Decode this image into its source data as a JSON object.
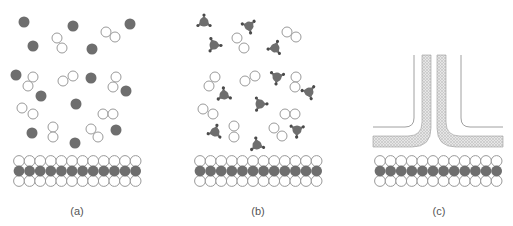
{
  "figure": {
    "panels": [
      {
        "id": "a",
        "label": "(a)",
        "description": "Free dark particles and hollow molecule pairs above a bilayer membrane"
      },
      {
        "id": "b",
        "label": "(b)",
        "description": "Triangular particles with bound dots and hollow molecule pairs above a bilayer membrane"
      },
      {
        "id": "c",
        "label": "(c)",
        "description": "Channel/pore structure with hatched lining above a bilayer membrane"
      }
    ]
  },
  "colors": {
    "dark": "#6e6e6e",
    "hollow_stroke": "#9a9a9a",
    "hatch": "#b5b5b5",
    "line": "#a0a0a0"
  },
  "panel_a": {
    "dark_particles": [
      [
        24,
        22
      ],
      [
        73,
        26
      ],
      [
        130,
        24
      ],
      [
        33,
        46
      ],
      [
        92,
        49
      ],
      [
        16,
        75
      ],
      [
        91,
        78
      ],
      [
        126,
        91
      ],
      [
        41,
        96
      ],
      [
        76,
        104
      ],
      [
        32,
        133
      ],
      [
        116,
        130
      ],
      [
        75,
        143
      ]
    ],
    "hollow_pairs": [
      [
        [
          57,
          38
        ],
        [
          62,
          48
        ]
      ],
      [
        [
          106,
          32
        ],
        [
          115,
          37
        ]
      ],
      [
        [
          33,
          77
        ],
        [
          28,
          86
        ]
      ],
      [
        [
          63,
          81
        ],
        [
          73,
          76
        ]
      ],
      [
        [
          116,
          77
        ],
        [
          113,
          87
        ]
      ],
      [
        [
          22,
          108
        ],
        [
          33,
          114
        ]
      ],
      [
        [
          103,
          114
        ],
        [
          113,
          114
        ]
      ],
      [
        [
          53,
          127
        ],
        [
          53,
          137
        ]
      ],
      [
        [
          91,
          129
        ],
        [
          98,
          137
        ]
      ]
    ]
  },
  "panel_b": {
    "triangles": [
      [
        204,
        22
      ],
      [
        249,
        26
      ],
      [
        214,
        45
      ],
      [
        275,
        48
      ],
      [
        277,
        77
      ],
      [
        224,
        95
      ],
      [
        309,
        92
      ],
      [
        260,
        104
      ],
      [
        215,
        132
      ],
      [
        297,
        130
      ],
      [
        257,
        145
      ]
    ],
    "hollow_pairs": [
      [
        [
          237,
          38
        ],
        [
          244,
          48
        ]
      ],
      [
        [
          287,
          32
        ],
        [
          296,
          37
        ]
      ],
      [
        [
          215,
          77
        ],
        [
          209,
          86
        ]
      ],
      [
        [
          245,
          81
        ],
        [
          255,
          76
        ]
      ],
      [
        [
          296,
          77
        ],
        [
          295,
          87
        ]
      ],
      [
        [
          203,
          109
        ],
        [
          213,
          114
        ]
      ],
      [
        [
          285,
          114
        ],
        [
          295,
          114
        ]
      ],
      [
        [
          234,
          126
        ],
        [
          234,
          137
        ]
      ],
      [
        [
          274,
          128
        ],
        [
          282,
          136
        ]
      ]
    ]
  },
  "membranes": [
    {
      "x0": 19,
      "count": 12,
      "spacing": 10.6,
      "y_top": 161,
      "y_mid": 171,
      "y_bot": 181
    },
    {
      "x0": 200,
      "count": 12,
      "spacing": 10.6,
      "y_top": 161,
      "y_mid": 171,
      "y_bot": 181
    },
    {
      "x0": 380,
      "count": 12,
      "spacing": 10.6,
      "y_top": 161,
      "y_mid": 171,
      "y_bot": 181
    }
  ],
  "labels": [
    {
      "text": "(a)",
      "x": 77,
      "y": 215
    },
    {
      "text": "(b)",
      "x": 258,
      "y": 215
    },
    {
      "text": "(c)",
      "x": 439,
      "y": 215
    }
  ]
}
